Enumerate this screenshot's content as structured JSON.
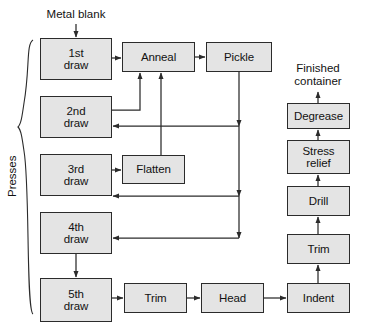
{
  "diagram": {
    "title_caption_top": "Metal blank",
    "title_caption_right": "Finished\ncontainer",
    "group_label": "Presses",
    "colors": {
      "node_fill": "#e4e4e4",
      "node_stroke": "#2b2b2b",
      "edge_stroke": "#2b2b2b",
      "text": "#121212",
      "background": "#ffffff"
    },
    "nodes": [
      {
        "id": "draw1",
        "label": "1st\ndraw",
        "x": 40,
        "y": 38,
        "w": 72,
        "h": 42
      },
      {
        "id": "draw2",
        "label": "2nd\ndraw",
        "x": 40,
        "y": 96,
        "w": 72,
        "h": 42
      },
      {
        "id": "draw3",
        "label": "3rd\ndraw",
        "x": 40,
        "y": 154,
        "w": 72,
        "h": 42
      },
      {
        "id": "draw4",
        "label": "4th\ndraw",
        "x": 40,
        "y": 212,
        "w": 72,
        "h": 42
      },
      {
        "id": "draw5",
        "label": "5th\ndraw",
        "x": 40,
        "y": 278,
        "w": 72,
        "h": 44
      },
      {
        "id": "anneal",
        "label": "Anneal",
        "x": 122,
        "y": 42,
        "w": 73,
        "h": 30
      },
      {
        "id": "pickle",
        "label": "Pickle",
        "x": 206,
        "y": 42,
        "w": 66,
        "h": 30
      },
      {
        "id": "flatten",
        "label": "Flatten",
        "x": 122,
        "y": 155,
        "w": 63,
        "h": 29
      },
      {
        "id": "trim_b",
        "label": "Trim",
        "x": 124,
        "y": 283,
        "w": 63,
        "h": 30
      },
      {
        "id": "head",
        "label": "Head",
        "x": 201,
        "y": 283,
        "w": 63,
        "h": 30
      },
      {
        "id": "indent",
        "label": "Indent",
        "x": 287,
        "y": 283,
        "w": 63,
        "h": 30
      },
      {
        "id": "trim_r",
        "label": "Trim",
        "x": 287,
        "y": 234,
        "w": 63,
        "h": 30
      },
      {
        "id": "drill",
        "label": "Drill",
        "x": 287,
        "y": 186,
        "w": 63,
        "h": 30
      },
      {
        "id": "stress",
        "label": "Stress\nrelief",
        "x": 287,
        "y": 140,
        "w": 63,
        "h": 34
      },
      {
        "id": "degrease",
        "label": "Degrease",
        "x": 287,
        "y": 103,
        "w": 63,
        "h": 26
      }
    ],
    "edges": [
      {
        "id": "blank-to-draw1",
        "from": "Metal blank",
        "to": "1st draw"
      },
      {
        "id": "draw1-to-anneal",
        "from": "1st draw",
        "to": "Anneal"
      },
      {
        "id": "anneal-to-pickle",
        "from": "Anneal",
        "to": "Pickle"
      },
      {
        "id": "draw2-to-anneal",
        "from": "2nd draw",
        "to": "Anneal"
      },
      {
        "id": "flatten-to-anneal",
        "from": "Flatten",
        "to": "Anneal"
      },
      {
        "id": "draw3-to-flatten",
        "from": "3rd draw",
        "to": "Flatten"
      },
      {
        "id": "pickle-to-draw2",
        "from": "Pickle",
        "to": "2nd draw"
      },
      {
        "id": "pickle-to-draw3",
        "from": "Pickle",
        "to": "3rd draw"
      },
      {
        "id": "pickle-to-draw4",
        "from": "Pickle",
        "to": "4th draw"
      },
      {
        "id": "draw4-to-draw5",
        "from": "4th draw",
        "to": "5th draw"
      },
      {
        "id": "draw5-to-trim",
        "from": "5th draw",
        "to": "Trim"
      },
      {
        "id": "trim-to-head",
        "from": "Trim",
        "to": "Head"
      },
      {
        "id": "head-to-indent",
        "from": "Head",
        "to": "Indent"
      },
      {
        "id": "indent-to-trimr",
        "from": "Indent",
        "to": "Trim"
      },
      {
        "id": "trimr-to-drill",
        "from": "Trim",
        "to": "Drill"
      },
      {
        "id": "drill-to-stress",
        "from": "Drill",
        "to": "Stress relief"
      },
      {
        "id": "stress-to-degrease",
        "from": "Stress relief",
        "to": "Degrease"
      },
      {
        "id": "degrease-to-out",
        "from": "Degrease",
        "to": "Finished container"
      }
    ]
  }
}
